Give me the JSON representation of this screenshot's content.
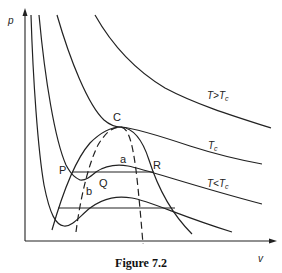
{
  "figure": {
    "caption": "Figure 7.2",
    "axes": {
      "y_label": "p",
      "x_label": "v"
    },
    "points": {
      "critical": "C",
      "P": "P",
      "Q": "Q",
      "R": "R",
      "a": "a",
      "b": "b"
    },
    "isotherm_labels": {
      "above": {
        "T": "T",
        "rel": ">",
        "Tc": "T",
        "sub": "c"
      },
      "critical": {
        "T": "T",
        "sub": "c"
      },
      "below": {
        "T": "T",
        "rel": "<",
        "Tc": "T",
        "sub": "c"
      }
    },
    "colors": {
      "ink": "#222222",
      "background": "#ffffff"
    }
  }
}
